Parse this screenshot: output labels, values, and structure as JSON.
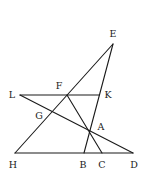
{
  "diagram": {
    "type": "geometry",
    "points": [
      {
        "id": "E",
        "label": "E",
        "x": 113,
        "y": 44,
        "lx": 113,
        "ly": 37
      },
      {
        "id": "F",
        "label": "F",
        "x": 67,
        "y": 95,
        "lx": 59,
        "ly": 89
      },
      {
        "id": "K",
        "label": "K",
        "x": 99,
        "y": 95,
        "lx": 108,
        "ly": 98
      },
      {
        "id": "L",
        "label": "L",
        "x": 20,
        "y": 95,
        "lx": 12,
        "ly": 98
      },
      {
        "id": "G",
        "label": "G",
        "x": 51,
        "y": 112,
        "lx": 39,
        "ly": 119
      },
      {
        "id": "A",
        "label": "A",
        "x": 90,
        "y": 132,
        "lx": 101,
        "ly": 130
      },
      {
        "id": "H",
        "label": "H",
        "x": 15,
        "y": 153,
        "lx": 13,
        "ly": 168
      },
      {
        "id": "B",
        "label": "B",
        "x": 84,
        "y": 153,
        "lx": 83,
        "ly": 168
      },
      {
        "id": "C",
        "label": "C",
        "x": 102,
        "y": 153,
        "lx": 102,
        "ly": 168
      },
      {
        "id": "D",
        "label": "D",
        "x": 133,
        "y": 153,
        "lx": 134,
        "ly": 168
      }
    ],
    "segments": [
      {
        "from": "H",
        "to": "E"
      },
      {
        "from": "E",
        "to": "B"
      },
      {
        "from": "L",
        "to": "K"
      },
      {
        "from": "L",
        "to": "D"
      },
      {
        "from": "F",
        "to": "C"
      },
      {
        "from": "H",
        "to": "D"
      }
    ]
  }
}
